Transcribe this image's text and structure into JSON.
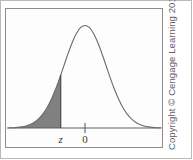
{
  "figure": {
    "kind": "normal-distribution-left-tail-diagram",
    "width": 193,
    "height": 160,
    "background_color": "#ffffff",
    "outer_frame_color": "#b9b9b9",
    "plot_box_border_color": "#8d8d8d"
  },
  "credit": {
    "text": "Copyright © Cengage Learning 2013",
    "color": "#5e5e5e",
    "orientation": "rotated-90-ccw"
  },
  "labels": {
    "z_label": "z",
    "zero_label": "0"
  },
  "chart_data": {
    "type": "area",
    "title": "",
    "subtitle": "",
    "xlabel": "",
    "ylabel": "",
    "grid": false,
    "legend": null,
    "legend_position": "none",
    "xlim": [
      -3.6,
      3.6
    ],
    "ylim": [
      0,
      0.42
    ],
    "tick_labels": [
      "z",
      "0"
    ],
    "tick_values": [
      -1.15,
      0
    ],
    "annotations": [
      {
        "text": "z",
        "x": -1.15,
        "y": 0,
        "note": "lower bound of shaded left tail"
      },
      {
        "text": "0",
        "x": 0,
        "y": 0,
        "note": "mean of the standard normal distribution"
      }
    ],
    "curve_color": "#6b6b6b",
    "curve_fill_color": "#fdfdfd",
    "shaded_region": {
      "label": "left tail area",
      "from_x": -3.6,
      "to_x": -1.15,
      "fill_color": "#808080"
    },
    "series": [
      {
        "name": "standard normal density",
        "x": [
          -3.6,
          -3.4,
          -3.2,
          -3.0,
          -2.8,
          -2.6,
          -2.4,
          -2.2,
          -2.0,
          -1.8,
          -1.6,
          -1.4,
          -1.2,
          -1.15,
          -1.0,
          -0.8,
          -0.6,
          -0.4,
          -0.2,
          0.0,
          0.2,
          0.4,
          0.6,
          0.8,
          1.0,
          1.2,
          1.4,
          1.6,
          1.8,
          2.0,
          2.2,
          2.4,
          2.6,
          2.8,
          3.0,
          3.2,
          3.4,
          3.6
        ],
        "values": [
          0.0006,
          0.0012,
          0.0024,
          0.0044,
          0.0079,
          0.0136,
          0.0224,
          0.0355,
          0.054,
          0.079,
          0.1109,
          0.1497,
          0.1942,
          0.2059,
          0.242,
          0.2897,
          0.3332,
          0.3683,
          0.391,
          0.3989,
          0.391,
          0.3683,
          0.3332,
          0.2897,
          0.242,
          0.1942,
          0.1497,
          0.1109,
          0.079,
          0.054,
          0.0355,
          0.0224,
          0.0136,
          0.0079,
          0.0044,
          0.0024,
          0.0012,
          0.0006
        ]
      }
    ]
  }
}
